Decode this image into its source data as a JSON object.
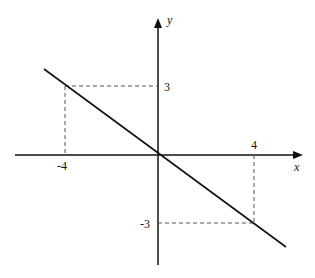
{
  "diagram": {
    "type": "coordinate-plane-line",
    "axes": {
      "x_label": "x",
      "y_label": "y"
    },
    "line": {
      "description": "straight line through origin with slope -3/4",
      "points": [
        [
          -4,
          3
        ],
        [
          0,
          0
        ],
        [
          4,
          -3
        ]
      ]
    },
    "tick_labels": {
      "x_neg": "-4",
      "x_pos": "4",
      "y_pos": "3",
      "y_neg": "-3"
    },
    "guides": "dashed projection lines from (-4,3) and (4,-3) to the axes",
    "colors": {
      "stroke": "#111111",
      "dashed": "#555555",
      "background": "#ffffff"
    }
  }
}
